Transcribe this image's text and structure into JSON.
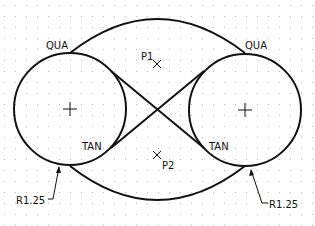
{
  "drawing": {
    "units_label": "R1.25",
    "circles": [
      {
        "id": "left",
        "cx": 70,
        "cy": 109,
        "r": 56,
        "center_mark": "plus"
      },
      {
        "id": "right",
        "cx": 245,
        "cy": 110,
        "r": 56,
        "center_mark": "plus"
      }
    ],
    "arcs": {
      "top": {
        "start": [
          70,
          53
        ],
        "end": [
          245,
          53
        ],
        "peak": [
          157,
          19
        ]
      },
      "bottom": {
        "start": [
          70,
          166
        ],
        "end": [
          245,
          166
        ],
        "bottom": [
          157,
          200
        ]
      }
    },
    "tangent_lines": [
      {
        "from": [
          111,
          71
        ],
        "to": [
          204,
          148
        ]
      },
      {
        "from": [
          111,
          148
        ],
        "to": [
          204,
          71
        ]
      }
    ],
    "points": [
      {
        "label": "P1",
        "x": 157,
        "y": 64
      },
      {
        "label": "P2",
        "x": 157,
        "y": 156
      }
    ],
    "labels": {
      "qua_left": "QUA",
      "qua_right": "QUA",
      "tan_left": "TAN",
      "tan_right": "TAN",
      "p1": "P1",
      "p2": "P2",
      "radius_left": "R1.25",
      "radius_right": "R1.25"
    },
    "colors": {
      "line": "#111111",
      "grid_dot": "#b8b8b8",
      "background": "#ffffff"
    }
  }
}
